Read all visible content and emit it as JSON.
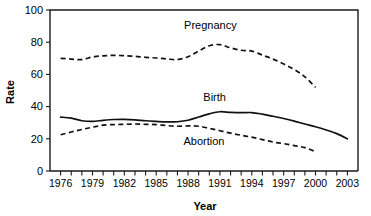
{
  "chart_data": {
    "type": "line",
    "title": "",
    "xlabel": "Year",
    "ylabel": "Rate",
    "xlim": [
      1975,
      2004
    ],
    "ylim": [
      0,
      100
    ],
    "grid": false,
    "legend_position": "inline-annotations",
    "ytick_values": [
      0,
      20,
      40,
      60,
      80,
      100
    ],
    "ytick_labels": [
      "0",
      "20",
      "40",
      "60",
      "80",
      "100"
    ],
    "xtick_labels": [
      "1976",
      "1979",
      "1982",
      "1985",
      "1988",
      "1991",
      "1994",
      "1997",
      "2000",
      "2003"
    ],
    "xtick_values": [
      1976,
      1979,
      1982,
      1985,
      1988,
      1991,
      1994,
      1997,
      2000,
      2003
    ],
    "xminor_step": 1,
    "x": [
      1976,
      1977,
      1978,
      1979,
      1980,
      1981,
      1982,
      1983,
      1984,
      1985,
      1986,
      1987,
      1988,
      1989,
      1990,
      1991,
      1992,
      1993,
      1994,
      1995,
      1996,
      1997,
      1998,
      1999,
      2000,
      2001,
      2002,
      2003
    ],
    "series": [
      {
        "name": "Pregnancy",
        "style": "dashed",
        "x": [
          1976,
          1977,
          1978,
          1979,
          1980,
          1981,
          1982,
          1983,
          1984,
          1985,
          1986,
          1987,
          1988,
          1989,
          1990,
          1991,
          1992,
          1993,
          1994,
          1995,
          1996,
          1997,
          1998,
          1999,
          2000
        ],
        "values": [
          70,
          69.5,
          69.2,
          70.8,
          71.5,
          71.8,
          71.6,
          71.2,
          70.6,
          70.2,
          69.6,
          69.2,
          71.0,
          74.5,
          77.8,
          78.5,
          76.5,
          75.0,
          74.5,
          72.0,
          69.5,
          66.5,
          63.0,
          58.5,
          52.0
        ],
        "label_text": "Pregnancy",
        "label_at": {
          "x": 1990.1,
          "y": 88
        }
      },
      {
        "name": "Birth",
        "style": "solid",
        "x": [
          1976,
          1977,
          1978,
          1979,
          1980,
          1981,
          1982,
          1983,
          1984,
          1985,
          1986,
          1987,
          1988,
          1989,
          1990,
          1991,
          1992,
          1993,
          1994,
          1995,
          1996,
          1997,
          1998,
          1999,
          2000,
          2001,
          2002,
          2003
        ],
        "values": [
          33.5,
          32.8,
          31.2,
          30.8,
          31.5,
          32.0,
          32.1,
          31.8,
          31.2,
          30.8,
          30.5,
          30.6,
          31.5,
          33.5,
          35.5,
          36.8,
          36.4,
          36.2,
          36.3,
          35.3,
          34.0,
          32.6,
          31.0,
          29.2,
          27.5,
          25.5,
          23.2,
          20.0
        ],
        "label_text": "Birth",
        "label_at": {
          "x": 1990.5,
          "y": 43.5
        }
      },
      {
        "name": "Abortion",
        "style": "dashed",
        "x": [
          1976,
          1977,
          1978,
          1979,
          1980,
          1981,
          1982,
          1983,
          1984,
          1985,
          1986,
          1987,
          1988,
          1989,
          1990,
          1991,
          1992,
          1993,
          1994,
          1995,
          1996,
          1997,
          1998,
          1999,
          2000
        ],
        "values": [
          22.5,
          24.2,
          25.8,
          27.2,
          28.5,
          28.8,
          29.0,
          29.2,
          29.0,
          28.8,
          28.2,
          27.8,
          28.0,
          27.8,
          26.5,
          25.0,
          23.5,
          22.2,
          21.0,
          19.5,
          18.0,
          17.0,
          15.8,
          14.5,
          12.0
        ],
        "label_text": "Abortion",
        "label_at": {
          "x": 1989.5,
          "y": 16.2
        }
      }
    ]
  }
}
